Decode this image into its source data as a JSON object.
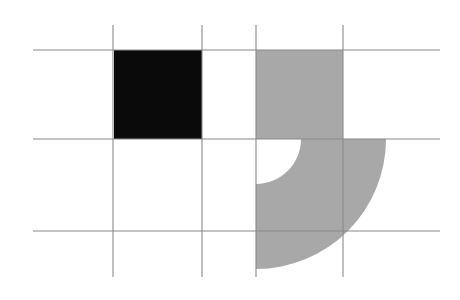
{
  "figure": {
    "canvas": {
      "width": 460,
      "height": 300,
      "background": "#ffffff"
    },
    "palette": {
      "background": "#ffffff",
      "grid_line": "#8a8a8a",
      "black_square_fill": "#0a0a0a",
      "gray_shape_fill": "#a8a8a8"
    },
    "grid": {
      "name": "reference-grid",
      "line_color": "#8a8a8a",
      "line_width": 1.1,
      "horizontal_lines": [
        {
          "id": "h-top",
          "y": 50,
          "x1": 33,
          "x2": 440
        },
        {
          "id": "h-middle",
          "y": 139,
          "x1": 33,
          "x2": 440
        },
        {
          "id": "h-bottom",
          "y": 231,
          "x1": 33,
          "x2": 440
        }
      ],
      "vertical_lines": [
        {
          "id": "v-1",
          "x": 113,
          "y1": 25,
          "y2": 277
        },
        {
          "id": "v-2",
          "x": 202,
          "y1": 25,
          "y2": 277
        },
        {
          "id": "v-3",
          "x": 256,
          "y1": 25,
          "y2": 277
        },
        {
          "id": "v-4",
          "x": 343,
          "y1": 25,
          "y2": 277
        }
      ]
    },
    "shapes": [
      {
        "id": "black-square",
        "kind": "rect",
        "fill": "#0a0a0a",
        "x": 114,
        "y": 50,
        "width": 88,
        "height": 89
      },
      {
        "id": "gray-square",
        "kind": "rect",
        "fill": "#a8a8a8",
        "x": 256,
        "y": 50,
        "width": 87,
        "height": 89
      },
      {
        "id": "gray-quarter-annulus",
        "kind": "quarter-annulus",
        "fill": "#a8a8a8",
        "center_x": 256,
        "center_y": 139,
        "outer_radius": 130,
        "inner_radius": 45,
        "start_angle_deg": 0,
        "sweep_deg": 90,
        "path": "M 343 139 A 87 0 0 0 1 343 139 Z"
      }
    ]
  }
}
